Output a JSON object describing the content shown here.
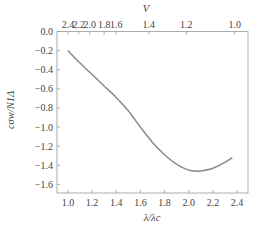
{
  "chart_data": {
    "type": "line",
    "title": "",
    "xlabel": "λ/λc",
    "ylabel": "cσw/N1Δ",
    "top_xlabel": "V",
    "xlim": [
      0.91,
      2.49
    ],
    "ylim": [
      -1.69,
      0.0
    ],
    "grid": false,
    "legend": null,
    "x_ticks": [
      "1.0",
      "1.2",
      "1.4",
      "1.6",
      "1.8",
      "2.0",
      "2.2",
      "2.4"
    ],
    "x_tick_values": [
      1.0,
      1.2,
      1.4,
      1.6,
      1.8,
      2.0,
      2.2,
      2.4
    ],
    "y_ticks": [
      "0.0",
      "−0.2",
      "−0.4",
      "−0.6",
      "−0.8",
      "−1.0",
      "−1.2",
      "−1.4",
      "−1.6"
    ],
    "y_tick_values": [
      0.0,
      -0.2,
      -0.4,
      -0.6,
      -0.8,
      -1.0,
      -1.2,
      -1.4,
      -1.6
    ],
    "top_ticks": [
      "2.4",
      "2.2",
      "2.0",
      "1.8",
      "1.6",
      "1.4",
      "1.2",
      "1.0"
    ],
    "top_tick_lambda": [
      1.0,
      1.09,
      1.18,
      1.3,
      1.4,
      1.67,
      1.98,
      2.38
    ],
    "series": [
      {
        "name": "cσw/N1Δ",
        "color": "#8a8a8a",
        "x": [
          1.0,
          1.1,
          1.2,
          1.3,
          1.4,
          1.5,
          1.6,
          1.7,
          1.8,
          1.9,
          2.0,
          2.06,
          2.1,
          2.2,
          2.3,
          2.36
        ],
        "y": [
          -0.2,
          -0.33,
          -0.45,
          -0.57,
          -0.69,
          -0.83,
          -1.0,
          -1.16,
          -1.29,
          -1.39,
          -1.45,
          -1.46,
          -1.46,
          -1.43,
          -1.37,
          -1.32
        ]
      }
    ]
  }
}
